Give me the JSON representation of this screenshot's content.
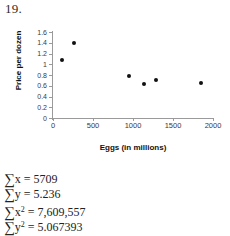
{
  "question_number": "19.",
  "chart_data": {
    "type": "scatter",
    "title": "",
    "xlabel": "Eggs (in millions)",
    "ylabel": "Price per dozen",
    "xlim": [
      0,
      2000
    ],
    "ylim": [
      0,
      1.6
    ],
    "xticks": [
      0,
      500,
      1000,
      1500,
      2000
    ],
    "xtick_labels": [
      "0",
      "500",
      "1000",
      "1500",
      "2000"
    ],
    "yticks": [
      0,
      0.2,
      0.4,
      0.6,
      0.8,
      1,
      1.2,
      1.4,
      1.6
    ],
    "ytick_labels": [
      "0",
      "0.2",
      "0.4",
      "0.6",
      "0.8",
      "1",
      "1.2",
      "1.4",
      "1.6"
    ],
    "grid": false,
    "legend": "none",
    "marker": "filled-circle",
    "marker_color": "#111111",
    "points": [
      {
        "x": 113,
        "y": 1.08
      },
      {
        "x": 264,
        "y": 1.4
      },
      {
        "x": 956,
        "y": 0.78
      },
      {
        "x": 1132,
        "y": 0.64
      },
      {
        "x": 1283,
        "y": 0.71
      },
      {
        "x": 1849,
        "y": 0.66
      }
    ]
  },
  "formulas": [
    {
      "symbol": "∑",
      "variable": "x",
      "exponent": "",
      "equals": "=",
      "value": "5709"
    },
    {
      "symbol": "∑",
      "variable": "y",
      "exponent": "",
      "equals": "=",
      "value": "5.236"
    },
    {
      "symbol": "∑",
      "variable": "x",
      "exponent": "2",
      "equals": "=",
      "value": "7,609,557"
    },
    {
      "symbol": "∑",
      "variable": "y",
      "exponent": "2",
      "equals": "=",
      "value": "5.067393"
    }
  ]
}
